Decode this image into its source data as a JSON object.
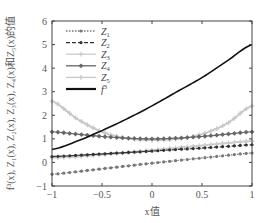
{
  "chart_data": {
    "type": "line",
    "title": "",
    "xlabel": "x值",
    "ylabel": "f³(x), Z₁(x), Z₂(x), Z₃(x), Z₄(x)和Z₅(x)的值",
    "xlim": [
      -1,
      1
    ],
    "ylim": [
      -1,
      6
    ],
    "xticks": [
      -1,
      -0.5,
      0,
      0.5,
      1
    ],
    "xtick_labels": [
      "−1",
      "−0.5",
      "0",
      "0.5",
      "1"
    ],
    "yticks": [
      -1,
      0,
      1,
      2,
      3,
      4,
      5,
      6
    ],
    "ytick_labels": [
      "−1",
      "0",
      "1",
      "2",
      "3",
      "4",
      "5",
      "6"
    ],
    "grid": false,
    "legend_position": "upper left",
    "x": [
      -1,
      -0.75,
      -0.5,
      -0.25,
      0,
      0.25,
      0.5,
      0.75,
      1
    ],
    "series": [
      {
        "name": "Z1",
        "label_main": "Z",
        "label_sub": "1",
        "style": "dotted",
        "marker": "dot",
        "color": "#777777",
        "values": [
          -0.5,
          -0.39,
          -0.27,
          -0.15,
          -0.03,
          0.08,
          0.19,
          0.3,
          0.4
        ]
      },
      {
        "name": "Z2",
        "label_main": "Z",
        "label_sub": "2",
        "style": "dashed",
        "marker": "dot",
        "color": "#333333",
        "values": [
          0.25,
          0.3,
          0.36,
          0.42,
          0.48,
          0.55,
          0.61,
          0.68,
          0.75
        ]
      },
      {
        "name": "Z3",
        "label_main": "Z",
        "label_sub": "3",
        "style": "solid",
        "marker": "plus",
        "color": "#cccccc",
        "values": [
          0.2,
          0.25,
          0.33,
          0.42,
          0.52,
          0.62,
          0.72,
          0.82,
          0.9
        ]
      },
      {
        "name": "Z4",
        "label_main": "Z",
        "label_sub": "4",
        "style": "solid",
        "marker": "diamond",
        "color": "#666666",
        "values": [
          1.3,
          1.2,
          1.1,
          1.03,
          1.0,
          1.03,
          1.1,
          1.2,
          1.3
        ]
      },
      {
        "name": "Z5",
        "label_main": "Z",
        "label_sub": "5",
        "style": "solid",
        "marker": "plus",
        "color": "#c8c8c8",
        "values": [
          2.6,
          1.85,
          1.3,
          1.02,
          0.95,
          1.0,
          1.2,
          1.65,
          2.4
        ]
      },
      {
        "name": "f3",
        "label_main": "f",
        "label_sub": "3",
        "style": "solid",
        "marker": "none",
        "color": "#111111",
        "values": [
          0.55,
          0.9,
          1.35,
          1.85,
          2.4,
          3.0,
          3.6,
          4.3,
          5.0
        ]
      }
    ]
  }
}
